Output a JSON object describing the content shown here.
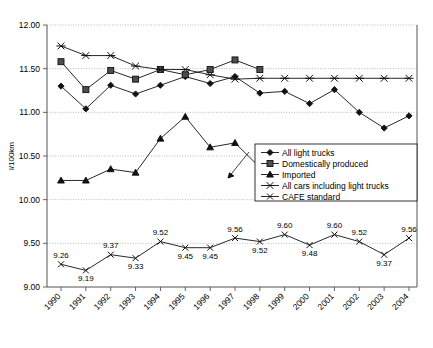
{
  "chart_data": {
    "type": "line",
    "title": "",
    "xlabel": "",
    "ylabel": "l/100km",
    "categories": [
      "1990",
      "1991",
      "1992",
      "1993",
      "1994",
      "1995",
      "1996",
      "1997",
      "1998",
      "1999",
      "2000",
      "2001",
      "2002",
      "2003",
      "2004"
    ],
    "ylim": [
      9.0,
      12.0
    ],
    "ytick_step": 0.5,
    "yticks": [
      "9.00",
      "9.50",
      "10.00",
      "10.50",
      "11.00",
      "11.50",
      "12.00"
    ],
    "grid": true,
    "legend_position": "inside-right",
    "series": [
      {
        "name": "All light trucks",
        "marker": "diamond",
        "values": [
          11.3,
          11.04,
          11.31,
          11.21,
          11.31,
          11.41,
          11.33,
          11.41,
          11.22,
          11.24,
          11.1,
          11.26,
          11.0,
          10.82,
          10.96
        ]
      },
      {
        "name": "Domestically produced",
        "marker": "square",
        "values": [
          11.58,
          11.26,
          11.48,
          11.38,
          11.49,
          11.43,
          11.49,
          11.6,
          11.49,
          null,
          null,
          null,
          null,
          null,
          null
        ]
      },
      {
        "name": "Imported",
        "marker": "triangle",
        "values": [
          10.22,
          10.22,
          10.35,
          10.31,
          10.7,
          10.95,
          10.6,
          10.65,
          10.37,
          null,
          null,
          null,
          null,
          null,
          null
        ]
      },
      {
        "name": "All cars including light trucks",
        "marker": "x",
        "values": [
          11.76,
          11.65,
          11.65,
          11.53,
          11.49,
          11.49,
          11.43,
          11.38,
          11.39,
          11.39,
          11.39,
          11.39,
          11.39,
          11.39,
          11.39
        ]
      },
      {
        "name": "CAFE standard",
        "marker": "x-small",
        "values": [
          9.26,
          9.19,
          9.37,
          9.33,
          9.52,
          9.45,
          9.45,
          9.56,
          9.52,
          9.6,
          9.48,
          9.6,
          9.52,
          9.37,
          9.56
        ],
        "data_labels": [
          "9.26",
          "9.19",
          "9.37",
          "9.33",
          "9.52",
          "9.45",
          "9.45",
          "9.56",
          "9.52",
          "9.60",
          "9.48",
          "9.60",
          "9.52",
          "9.37",
          "9.56"
        ],
        "data_label_positions": [
          "above",
          "below",
          "above",
          "below",
          "above",
          "below",
          "below",
          "above",
          "below",
          "above",
          "below",
          "above",
          "above",
          "below",
          "above"
        ]
      }
    ]
  },
  "legend": {
    "items": [
      {
        "label": "All light trucks",
        "marker": "diamond"
      },
      {
        "label": "Domestically produced",
        "marker": "square"
      },
      {
        "label": "Imported",
        "marker": "triangle"
      },
      {
        "label": "All cars including light trucks",
        "marker": "x"
      },
      {
        "label": "CAFE standard",
        "marker": "x-small"
      }
    ]
  }
}
